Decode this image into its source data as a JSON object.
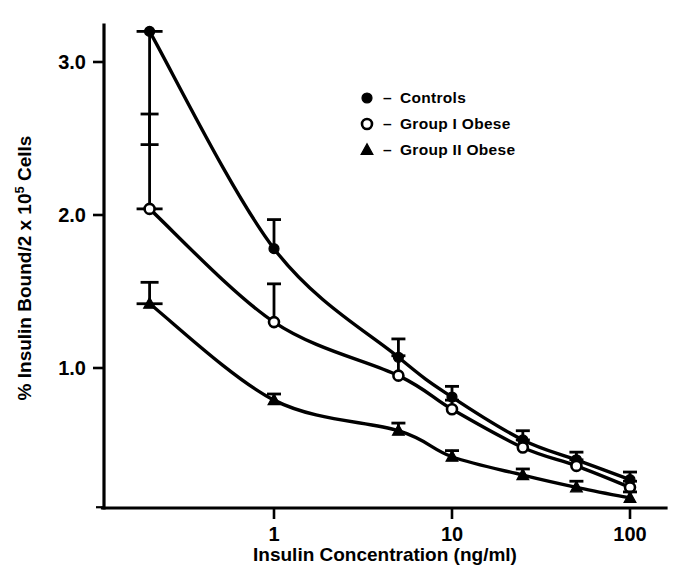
{
  "chart_data": {
    "type": "line",
    "title": "",
    "xlabel": "Insulin Concentration (ng/ml)",
    "ylabel_main": "% Insulin Bound/2 x 10",
    "ylabel_sup": "5",
    "ylabel_tail": " Cells",
    "ylabel_full": "% Insulin Bound/2 x 10⁵ Cells",
    "xscale": "log",
    "yscale": "linear",
    "xlim": [
      0.13,
      130
    ],
    "ylim": [
      0.0,
      3.45
    ],
    "xticks": [
      1,
      10,
      100
    ],
    "xtick_labels": [
      "1",
      "10",
      "100"
    ],
    "yticks": [
      1.0,
      2.0,
      3.0
    ],
    "ytick_labels": [
      "1.0",
      "2.0",
      "3.0"
    ],
    "grid": false,
    "legend_position": "upper-right-inside",
    "x": [
      0.2,
      1,
      5,
      10,
      25,
      50,
      100
    ],
    "series": [
      {
        "name": "Controls",
        "marker": "filled-circle",
        "values": [
          3.2,
          1.78,
          1.07,
          0.81,
          0.53,
          0.4,
          0.27
        ],
        "errors": [
          0.37,
          0.19,
          0.12,
          0.07,
          0.06,
          0.05,
          0.05
        ]
      },
      {
        "name": "Group I Obese",
        "marker": "open-circle",
        "values": [
          2.04,
          1.3,
          0.95,
          0.73,
          0.48,
          0.36,
          0.22
        ],
        "errors": [
          0.31,
          0.25,
          0.13,
          0.06,
          0.05,
          0.04,
          0.04
        ]
      },
      {
        "name": "Group II Obese",
        "marker": "filled-triangle",
        "values": [
          1.42,
          0.79,
          0.59,
          0.42,
          0.3,
          0.22,
          0.15
        ],
        "errors": [
          0.07,
          0.04,
          0.05,
          0.04,
          0.04,
          0.04,
          0.04
        ]
      }
    ],
    "legend": [
      {
        "marker": "filled-circle",
        "dash": "–",
        "label": "Controls"
      },
      {
        "marker": "open-circle",
        "dash": "–",
        "label": "Group I Obese"
      },
      {
        "marker": "filled-triangle",
        "dash": "–",
        "label": "Group II Obese"
      }
    ],
    "colors": {
      "ink": "#000000",
      "background": "#ffffff"
    }
  }
}
